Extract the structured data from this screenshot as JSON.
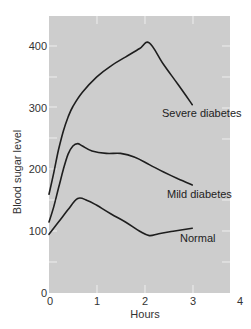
{
  "chart_data": {
    "type": "line",
    "title": "",
    "xlabel": "Hours",
    "ylabel": "Blood sugar level",
    "xlim": [
      0,
      4
    ],
    "ylim": [
      0,
      450
    ],
    "x_ticks": [
      0,
      1,
      2,
      3,
      4
    ],
    "y_ticks": [
      0,
      100,
      200,
      300,
      400
    ],
    "x_tick_labels": [
      "0",
      "1",
      "2",
      "3",
      "4"
    ],
    "y_tick_labels": [
      "0",
      "100",
      "200",
      "300",
      "400"
    ],
    "grid": false,
    "legend": "inline labels",
    "background": "#cfcfcf",
    "series": [
      {
        "name": "Severe diabetes",
        "x": [
          0,
          0.1,
          0.2,
          0.3,
          0.4,
          0.5,
          0.7,
          1.0,
          1.3,
          1.6,
          1.9,
          2.1,
          2.4,
          2.7,
          3.0
        ],
        "values": [
          160,
          195,
          232,
          262,
          285,
          302,
          325,
          350,
          368,
          382,
          396,
          405,
          370,
          338,
          305
        ]
      },
      {
        "name": "Mild diabetes",
        "x": [
          0,
          0.1,
          0.2,
          0.3,
          0.4,
          0.5,
          0.6,
          0.7,
          0.9,
          1.2,
          1.5,
          1.8,
          2.1,
          2.4,
          2.7,
          3.0
        ],
        "values": [
          115,
          140,
          170,
          200,
          225,
          238,
          242,
          238,
          230,
          226,
          226,
          220,
          208,
          196,
          185,
          175
        ]
      },
      {
        "name": "Normal",
        "x": [
          0,
          0.2,
          0.4,
          0.6,
          0.8,
          1.0,
          1.3,
          1.6,
          1.9,
          2.1,
          2.3,
          2.6,
          3.0
        ],
        "values": [
          95,
          115,
          135,
          153,
          150,
          142,
          128,
          115,
          100,
          93,
          96,
          100,
          105
        ]
      }
    ]
  },
  "labels": {
    "severe": "Severe diabetes",
    "mild": "Mild diabetes",
    "normal": "Normal",
    "xlabel": "Hours",
    "ylabel": "Blood sugar level",
    "x_ticks": [
      "0",
      "1",
      "2",
      "3",
      "4"
    ],
    "y_ticks": [
      "0",
      "100",
      "200",
      "300",
      "400"
    ]
  }
}
